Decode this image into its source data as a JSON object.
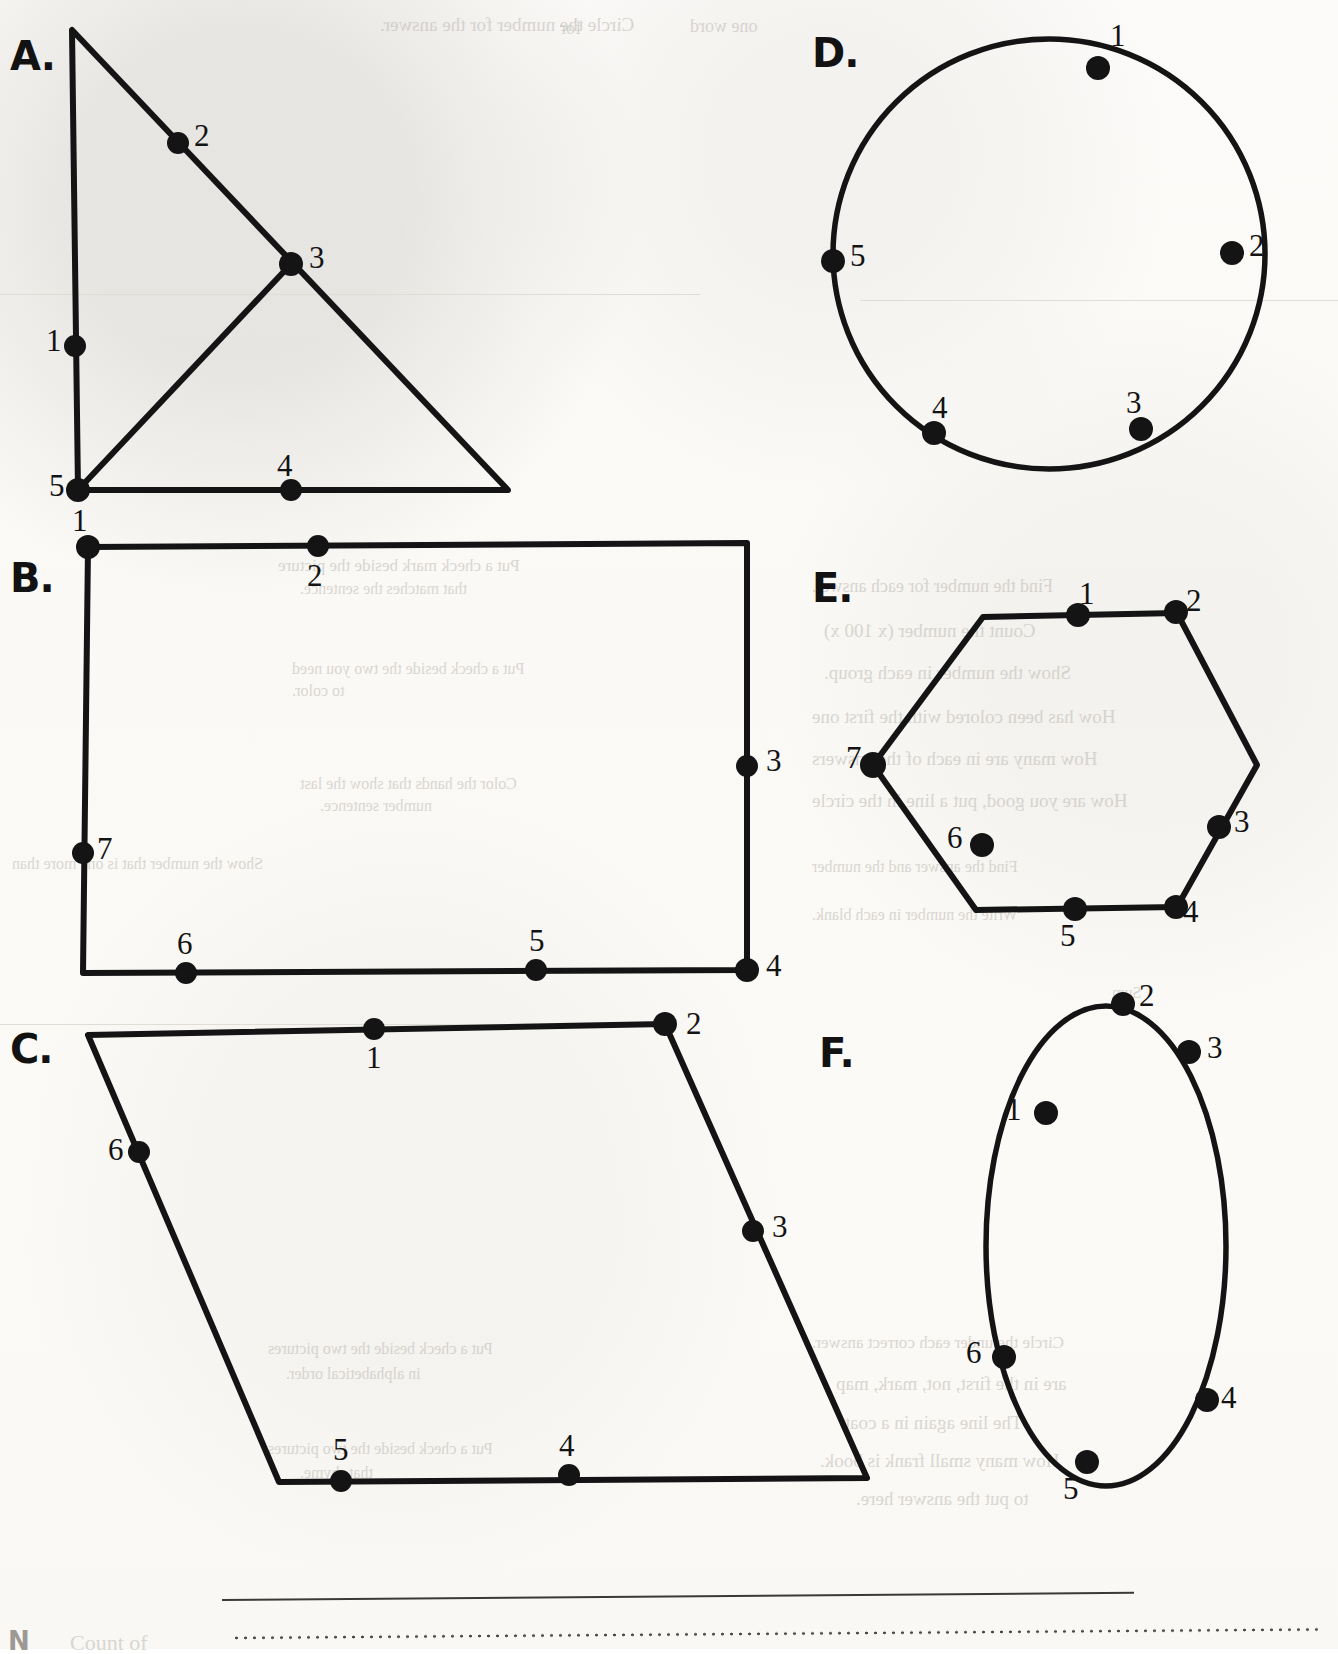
{
  "page": {
    "background_color": "#fbfaf8",
    "ink_color": "#141414"
  },
  "figures": [
    {
      "id": "A",
      "label": "A.",
      "shape": "right-triangle-with-inner-segment",
      "label_pos": [
        10,
        33
      ],
      "points": [
        {
          "n": "1",
          "dot": [
            75,
            346
          ],
          "label": [
            46,
            325
          ]
        },
        {
          "n": "2",
          "dot": [
            178,
            143
          ],
          "label": [
            194,
            120
          ]
        },
        {
          "n": "3",
          "dot": [
            291,
            264
          ],
          "label": [
            309,
            242
          ]
        },
        {
          "n": "4",
          "dot": [
            291,
            490
          ],
          "label": [
            277,
            450
          ]
        },
        {
          "n": "5",
          "dot": [
            78,
            490
          ],
          "label": [
            49,
            470
          ]
        }
      ]
    },
    {
      "id": "B",
      "label": "B.",
      "shape": "rectangle",
      "label_pos": [
        10,
        555
      ],
      "points": [
        {
          "n": "1",
          "dot": [
            88,
            547
          ],
          "label": [
            72,
            505
          ]
        },
        {
          "n": "2",
          "dot": [
            318,
            546
          ],
          "label": [
            307,
            560
          ]
        },
        {
          "n": "3",
          "dot": [
            747,
            766
          ],
          "label": [
            766,
            745
          ]
        },
        {
          "n": "4",
          "dot": [
            747,
            970
          ],
          "label": [
            766,
            950
          ]
        },
        {
          "n": "5",
          "dot": [
            536,
            970
          ],
          "label": [
            529,
            925
          ]
        },
        {
          "n": "6",
          "dot": [
            186,
            973
          ],
          "label": [
            177,
            928
          ]
        },
        {
          "n": "7",
          "dot": [
            83,
            853
          ],
          "label": [
            97,
            833
          ]
        }
      ]
    },
    {
      "id": "C",
      "label": "C.",
      "shape": "parallelogram",
      "label_pos": [
        10,
        1026
      ],
      "points": [
        {
          "n": "1",
          "dot": [
            374,
            1029
          ],
          "label": [
            366,
            1042
          ]
        },
        {
          "n": "2",
          "dot": [
            665,
            1024
          ],
          "label": [
            686,
            1008
          ]
        },
        {
          "n": "3",
          "dot": [
            753,
            1231
          ],
          "label": [
            772,
            1211
          ]
        },
        {
          "n": "4",
          "dot": [
            569,
            1475
          ],
          "label": [
            559,
            1430
          ]
        },
        {
          "n": "5",
          "dot": [
            341,
            1481
          ],
          "label": [
            333,
            1434
          ]
        },
        {
          "n": "6",
          "dot": [
            139,
            1152
          ],
          "label": [
            108,
            1134
          ]
        }
      ]
    },
    {
      "id": "D",
      "label": "D.",
      "shape": "circle",
      "label_pos": [
        812,
        30
      ],
      "points": [
        {
          "n": "1",
          "dot": [
            1098,
            68
          ],
          "label": [
            1110,
            20
          ]
        },
        {
          "n": "2",
          "dot": [
            1232,
            253
          ],
          "label": [
            1249,
            230
          ]
        },
        {
          "n": "3",
          "dot": [
            1141,
            429
          ],
          "label": [
            1126,
            387
          ]
        },
        {
          "n": "4",
          "dot": [
            934,
            433
          ],
          "label": [
            932,
            392
          ]
        },
        {
          "n": "5",
          "dot": [
            833,
            261
          ],
          "label": [
            850,
            240
          ]
        }
      ]
    },
    {
      "id": "E",
      "label": "E.",
      "shape": "hexagon",
      "label_pos": [
        812,
        565
      ],
      "points": [
        {
          "n": "1",
          "dot": [
            1078,
            615
          ],
          "label": [
            1079,
            578
          ]
        },
        {
          "n": "2",
          "dot": [
            1176,
            612
          ],
          "label": [
            1186,
            585
          ]
        },
        {
          "n": "3",
          "dot": [
            1219,
            827
          ],
          "label": [
            1234,
            806
          ]
        },
        {
          "n": "4",
          "dot": [
            1176,
            907
          ],
          "label": [
            1183,
            896
          ]
        },
        {
          "n": "5",
          "dot": [
            1075,
            909
          ],
          "label": [
            1060,
            920
          ]
        },
        {
          "n": "6",
          "dot": [
            982,
            845
          ],
          "label": [
            947,
            822
          ]
        },
        {
          "n": "7",
          "dot": [
            873,
            765
          ],
          "label": [
            846,
            742
          ]
        }
      ]
    },
    {
      "id": "F",
      "label": "F.",
      "shape": "ellipse",
      "label_pos": [
        819,
        1030
      ],
      "points": [
        {
          "n": "1",
          "dot": [
            1046,
            1113
          ],
          "label": [
            1006,
            1094
          ]
        },
        {
          "n": "2",
          "dot": [
            1123,
            1004
          ],
          "label": [
            1139,
            980
          ]
        },
        {
          "n": "3",
          "dot": [
            1189,
            1052
          ],
          "label": [
            1207,
            1032
          ]
        },
        {
          "n": "4",
          "dot": [
            1207,
            1400
          ],
          "label": [
            1221,
            1382
          ]
        },
        {
          "n": "5",
          "dot": [
            1087,
            1462
          ],
          "label": [
            1063,
            1473
          ]
        },
        {
          "n": "6",
          "dot": [
            1004,
            1357
          ],
          "label": [
            966,
            1337
          ]
        }
      ]
    }
  ],
  "rules": {
    "solid_rule": {
      "x": 222,
      "y": 1599,
      "width": 912,
      "height": 2
    },
    "dotted_rule": {
      "x": 232,
      "y": 1638,
      "width": 1086
    }
  },
  "ghost_text": {
    "note": "faint show-through text from the reverse side of the page",
    "lines": [
      {
        "text": "Circle the number for the answer.",
        "x": 380,
        "y": 14,
        "size": 19,
        "mirrored": true
      },
      {
        "text": "one word",
        "x": 690,
        "y": 16,
        "size": 18,
        "mirrored": true
      },
      {
        "text": "for",
        "x": 560,
        "y": 18,
        "size": 18,
        "mirrored": true
      },
      {
        "text": "Put a check mark beside the picture",
        "x": 278,
        "y": 556,
        "size": 17,
        "mirrored": true
      },
      {
        "text": "that matches the sentence.",
        "x": 300,
        "y": 580,
        "size": 16,
        "mirrored": true
      },
      {
        "text": "Put a check beside the two you need",
        "x": 292,
        "y": 660,
        "size": 16,
        "mirrored": true
      },
      {
        "text": "to color.",
        "x": 292,
        "y": 682,
        "size": 16,
        "mirrored": true
      },
      {
        "text": "Color the hands that show the last",
        "x": 300,
        "y": 775,
        "size": 16,
        "mirrored": true
      },
      {
        "text": "number sentence.",
        "x": 320,
        "y": 797,
        "size": 16,
        "mirrored": true
      },
      {
        "text": "Show the number that is one more than",
        "x": 12,
        "y": 855,
        "size": 16,
        "mirrored": true
      },
      {
        "text": "Put a check beside the two pictures",
        "x": 268,
        "y": 1340,
        "size": 16,
        "mirrored": true
      },
      {
        "text": "in alphabetical order.",
        "x": 286,
        "y": 1365,
        "size": 16,
        "mirrored": true
      },
      {
        "text": "Put a check beside the two pictures",
        "x": 268,
        "y": 1440,
        "size": 16,
        "mirrored": true
      },
      {
        "text": "that rhyme.",
        "x": 300,
        "y": 1464,
        "size": 16,
        "mirrored": true
      },
      {
        "text": "Find the number for each answer.",
        "x": 812,
        "y": 576,
        "size": 18,
        "mirrored": true
      },
      {
        "text": "Count the number (x   100 x)",
        "x": 824,
        "y": 620,
        "size": 19,
        "mirrored": true
      },
      {
        "text": "Show the number in each group.",
        "x": 824,
        "y": 662,
        "size": 19,
        "mirrored": true
      },
      {
        "text": "How has been colored with the first one",
        "x": 812,
        "y": 706,
        "size": 19,
        "mirrored": true
      },
      {
        "text": "How many are in each of the answers",
        "x": 812,
        "y": 748,
        "size": 19,
        "mirrored": true
      },
      {
        "text": "How are you good, put a line in the circle",
        "x": 812,
        "y": 790,
        "size": 19,
        "mirrored": true
      },
      {
        "text": "Find the answer and the number",
        "x": 812,
        "y": 858,
        "size": 16,
        "mirrored": true
      },
      {
        "text": "Write the number in each blank.",
        "x": 812,
        "y": 906,
        "size": 16,
        "mirrored": true
      },
      {
        "text": "Sum",
        "x": 1112,
        "y": 984,
        "size": 16,
        "mirrored": true
      },
      {
        "text": "Circle the under each correct answer.",
        "x": 812,
        "y": 1333,
        "size": 17,
        "mirrored": true
      },
      {
        "text": "are in the first, not, mark, map",
        "x": 836,
        "y": 1373,
        "size": 19,
        "mirrored": true
      },
      {
        "text": "The line again in a coat.",
        "x": 840,
        "y": 1412,
        "size": 19,
        "mirrored": true
      },
      {
        "text": "How many small frank is book.",
        "x": 820,
        "y": 1450,
        "size": 19,
        "mirrored": true
      },
      {
        "text": "to put the answer here.",
        "x": 856,
        "y": 1488,
        "size": 19,
        "mirrored": true
      },
      {
        "text": "Count of",
        "x": 70,
        "y": 1630,
        "size": 22,
        "mirrored": false
      }
    ]
  }
}
